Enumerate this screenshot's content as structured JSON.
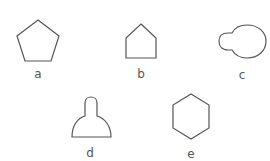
{
  "figure": {
    "shapes": [
      {
        "id": "a",
        "label": "a",
        "kind": "pentagon"
      },
      {
        "id": "b",
        "label": "b",
        "kind": "house-pentagon"
      },
      {
        "id": "c",
        "label": "c",
        "kind": "keyhole-blob"
      },
      {
        "id": "d",
        "label": "d",
        "kind": "bell"
      },
      {
        "id": "e",
        "label": "e",
        "kind": "hexagon"
      }
    ],
    "stroke_color": "#555555"
  }
}
